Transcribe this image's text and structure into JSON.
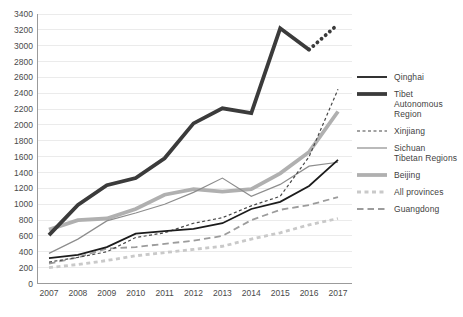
{
  "chart_data": {
    "type": "line",
    "title": "",
    "xlabel": "",
    "ylabel": "",
    "x": [
      2007,
      2008,
      2009,
      2010,
      2011,
      2012,
      2013,
      2014,
      2015,
      2016,
      2017
    ],
    "x_tick_labels": [
      "2007",
      "2008",
      "2009",
      "2010",
      "2011",
      "2012",
      "2013",
      "2014",
      "2015",
      "2016",
      "2017"
    ],
    "ylim": [
      0,
      3400
    ],
    "ytick_interval": 200,
    "y_tick_labels": [
      "0",
      "200",
      "400",
      "600",
      "800",
      "1000",
      "1200",
      "1400",
      "1600",
      "1800",
      "2000",
      "2200",
      "2400",
      "2600",
      "2800",
      "3000",
      "3200",
      "3400"
    ],
    "grid": "horizontal",
    "legend_position": "right",
    "series": [
      {
        "name": "Qinghai",
        "slug": "qinghai",
        "color": "#1c1c1c",
        "width": 1.8,
        "dash": null,
        "last_segment": "solid",
        "values": [
          320,
          360,
          460,
          630,
          660,
          690,
          760,
          940,
          1030,
          1230,
          1560
        ]
      },
      {
        "name": "Tibet Autonomous Region",
        "slug": "tibet-autonomous-region",
        "color": "#3b3b3b",
        "width": 3.8,
        "dash": null,
        "last_segment": "dotted",
        "values": [
          610,
          990,
          1240,
          1330,
          1580,
          2020,
          2210,
          2150,
          3220,
          2950,
          3270
        ]
      },
      {
        "name": "Xinjiang",
        "slug": "xinjiang",
        "color": "#474747",
        "width": 1.2,
        "dash": "3 2.5",
        "last_segment": "solid",
        "values": [
          270,
          330,
          400,
          580,
          640,
          760,
          830,
          980,
          1100,
          1600,
          2450
        ]
      },
      {
        "name": "Sichuan Tibetan Regions",
        "slug": "sichuan-tibetan-regions",
        "color": "#8d8d8d",
        "width": 1.2,
        "dash": null,
        "last_segment": "solid",
        "values": [
          380,
          560,
          790,
          890,
          1000,
          1150,
          1330,
          1100,
          1250,
          1480,
          1530
        ]
      },
      {
        "name": "Beijing",
        "slug": "beijing",
        "color": "#b0b0b0",
        "width": 3.8,
        "dash": null,
        "last_segment": "solid",
        "values": [
          680,
          800,
          820,
          940,
          1120,
          1190,
          1160,
          1190,
          1390,
          1660,
          2170
        ]
      },
      {
        "name": "All provinces",
        "slug": "all-provinces",
        "color": "#c9c9c9",
        "width": 2.8,
        "dash": "4 3.5",
        "last_segment": "solid",
        "values": [
          200,
          240,
          290,
          350,
          390,
          430,
          470,
          560,
          640,
          740,
          820
        ]
      },
      {
        "name": "Guangdong",
        "slug": "guangdong",
        "color": "#9c9c9c",
        "width": 1.8,
        "dash": "6.5 4",
        "last_segment": "solid",
        "values": [
          250,
          330,
          440,
          460,
          500,
          540,
          600,
          800,
          930,
          990,
          1090
        ]
      }
    ],
    "legend_labels": [
      [
        "Qinghai"
      ],
      [
        "Tibet",
        "Autonomous",
        "Region"
      ],
      [
        "Xinjiang"
      ],
      [
        "Sichuan",
        "Tibetan Regions"
      ],
      [
        "Beijing"
      ],
      [
        "All provinces"
      ],
      [
        "Guangdong"
      ]
    ],
    "draw_order": [
      5,
      6,
      4,
      3,
      2,
      0,
      1
    ]
  },
  "style": {
    "grid_color": "#ebebeb",
    "axis_color": "#9b9b9b",
    "tick_label_color": "#4a4a4a"
  }
}
